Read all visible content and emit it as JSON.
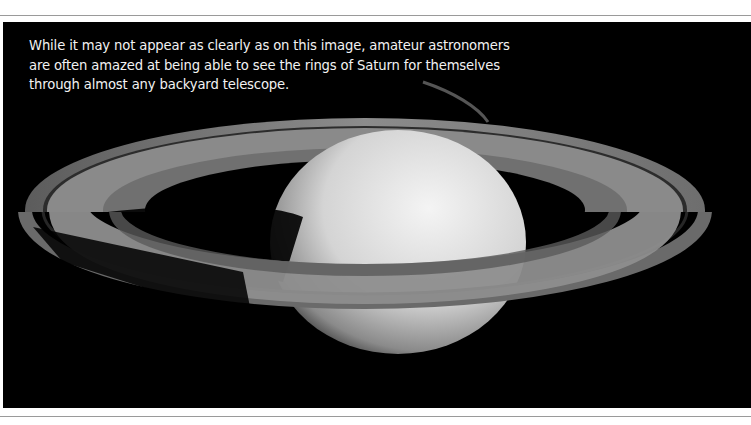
{
  "caption": {
    "lines": [
      "While it may not appear as clearly as on this image, amateur astronomers",
      "are often amazed at being able to see the rings of Saturn for themselves",
      "through almost any backyard telescope."
    ]
  },
  "image": {
    "subject": "Saturn with rings",
    "background_color": "#000000",
    "planet_color": "#d9d9d9",
    "ring_color": "#7a7a7a"
  }
}
